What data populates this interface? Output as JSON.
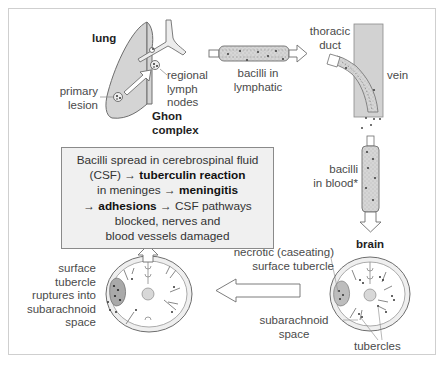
{
  "figure": {
    "labels": {
      "lung": "lung",
      "primary_lesion_1": "primary",
      "primary_lesion_2": "lesion",
      "regional_1": "regional",
      "regional_2": "lymph",
      "regional_3": "nodes",
      "ghon_1": "Ghon",
      "ghon_2": "complex",
      "lymphatic_1": "bacilli in",
      "lymphatic_2": "lymphatic",
      "thoracic_1": "thoracic",
      "thoracic_2": "duct",
      "vein": "vein",
      "blood_1": "bacilli",
      "blood_2": "in blood*",
      "brain": "brain",
      "necrotic_1": "necrotic (caseating)",
      "necrotic_2": "surface tubercle",
      "subarachnoid_1": "subarachnoid",
      "subarachnoid_2": "space",
      "tubercles": "tubercles",
      "rupture_1": "surface",
      "rupture_2": "tubercle",
      "rupture_3": "ruptures into",
      "rupture_4": "subarachnoid",
      "rupture_5": "space"
    },
    "box": {
      "line1": "Bacilli spread in cerebrospinal fluid",
      "line2_pre": "(CSF) → ",
      "line2_bold": "tuberculin reaction",
      "line3_pre": "in meninges → ",
      "line3_bold": "meningitis",
      "line4_pre": "→ ",
      "line4_bold": "adhesions",
      "line4_post": " → CSF pathways",
      "line5": "blocked, nerves and",
      "line6": "blood vessels damaged"
    },
    "colors": {
      "tissue_fill": "#d4d4d4",
      "outline": "#6e6e6e",
      "box_fill": "#f0f0f0",
      "dots": "#444444"
    }
  }
}
